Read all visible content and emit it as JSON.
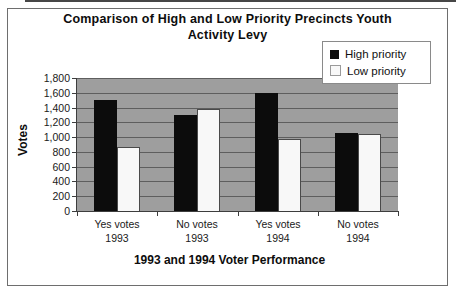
{
  "page": {
    "background": "#ffffff"
  },
  "chart_data": {
    "type": "bar",
    "title": "Comparison of High and Low Priority Precincts Youth Activity Levy",
    "title_lines": [
      "Comparison of High and Low Priority Precincts Youth",
      "Activity Levy"
    ],
    "xlabel": "1993 and 1994 Voter Performance",
    "ylabel": "Votes",
    "categories": [
      "Yes votes\n1993",
      "No  votes\n1993",
      "Yes votes\n1994",
      "No  votes\n1994"
    ],
    "series": [
      {
        "name": "High priority",
        "color": "#0c0c0c",
        "values": [
          1500,
          1300,
          1600,
          1060
        ]
      },
      {
        "name": "Low priority",
        "color": "#f8f8f8",
        "values": [
          860,
          1380,
          980,
          1040
        ]
      }
    ],
    "ylim": [
      0,
      1800
    ],
    "ytick_step": 200,
    "grid": true,
    "legend_position": "top-right",
    "colors": {
      "plot_background": "#9e9e9e",
      "gridline": "#5e5e5e",
      "axis": "#3d3d3d",
      "low_swatch_border": "#9a9a9a"
    }
  }
}
